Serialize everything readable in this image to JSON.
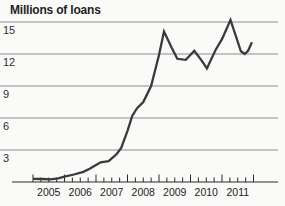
{
  "chart_data": {
    "type": "line",
    "title": "Millions of loans",
    "xlabel": "",
    "ylabel": "Millions of loans",
    "xlim": [
      2005,
      2012
    ],
    "ylim": [
      0,
      15.5
    ],
    "grid": "horizontal",
    "legend": "none",
    "y_ticks": [
      3,
      6,
      9,
      12,
      15
    ],
    "x_tick_labels": [
      "2005",
      "2006",
      "2007",
      "2008",
      "2009",
      "2010",
      "2011"
    ],
    "x_minor_ticks_per_year": 4,
    "series": [
      {
        "name": "loans-millions",
        "points": [
          [
            2005.0,
            0.3
          ],
          [
            2005.3,
            0.28
          ],
          [
            2005.55,
            0.25
          ],
          [
            2005.8,
            0.35
          ],
          [
            2006.0,
            0.5
          ],
          [
            2006.3,
            0.7
          ],
          [
            2006.6,
            0.95
          ],
          [
            2006.8,
            1.25
          ],
          [
            2007.0,
            1.6
          ],
          [
            2007.15,
            1.85
          ],
          [
            2007.4,
            1.95
          ],
          [
            2007.65,
            2.6
          ],
          [
            2007.8,
            3.2
          ],
          [
            2008.0,
            4.8
          ],
          [
            2008.15,
            6.2
          ],
          [
            2008.3,
            6.9
          ],
          [
            2008.5,
            7.5
          ],
          [
            2008.75,
            9.0
          ],
          [
            2009.0,
            11.9
          ],
          [
            2009.16,
            14.1
          ],
          [
            2009.4,
            12.6
          ],
          [
            2009.58,
            11.55
          ],
          [
            2009.85,
            11.45
          ],
          [
            2010.12,
            12.3
          ],
          [
            2010.35,
            11.4
          ],
          [
            2010.52,
            10.65
          ],
          [
            2010.8,
            12.4
          ],
          [
            2011.0,
            13.4
          ],
          [
            2011.27,
            15.2
          ],
          [
            2011.6,
            12.25
          ],
          [
            2011.72,
            12.0
          ],
          [
            2011.83,
            12.3
          ],
          [
            2011.95,
            13.1
          ]
        ]
      }
    ],
    "annotations": []
  },
  "colors": {
    "background": "#fafaf9",
    "line": "#3a3a3a",
    "gridline": "#8d8d8d",
    "axis": "#2a2a2a",
    "title_text": "#1f1f1f",
    "label_text": "#2e2e2e"
  }
}
